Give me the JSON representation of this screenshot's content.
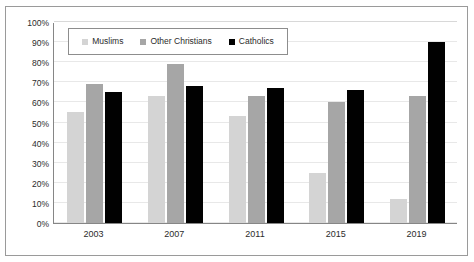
{
  "chart_data": {
    "type": "bar",
    "title": "",
    "subtitle": "",
    "xlabel": "",
    "ylabel": "",
    "categories": [
      "2003",
      "2007",
      "2011",
      "2015",
      "2019"
    ],
    "series": [
      {
        "name": "Muslims",
        "color": "#d4d4d4",
        "values": [
          55,
          63,
          53,
          25,
          12
        ]
      },
      {
        "name": "Other Christians",
        "color": "#a6a6a6",
        "values": [
          69,
          79,
          63,
          60,
          63
        ]
      },
      {
        "name": "Catholics",
        "color": "#010101",
        "values": [
          65,
          68,
          67,
          66,
          90
        ]
      }
    ],
    "ylim": [
      0,
      100
    ],
    "ytick_step": 10,
    "ytick_labels": [
      "0%",
      "10%",
      "20%",
      "30%",
      "40%",
      "50%",
      "60%",
      "70%",
      "80%",
      "90%",
      "100%"
    ],
    "ytick_values": [
      0,
      10,
      20,
      30,
      40,
      50,
      60,
      70,
      80,
      90,
      100
    ],
    "grid": true,
    "grid_axis": "y",
    "legend_position": "top-center-inside",
    "value_suffix": "%",
    "frame_border_color": "#9a9a9a",
    "axis_color": "#868686",
    "gridline_color": "#e8e8e8"
  }
}
